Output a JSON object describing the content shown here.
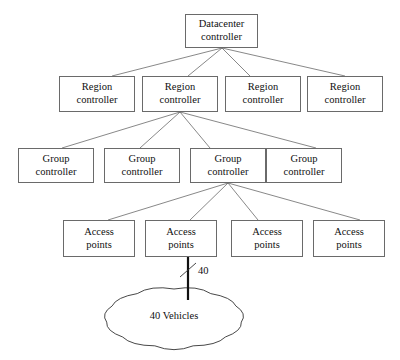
{
  "diagram": {
    "style": {
      "box_border_color": "#6a6a6a",
      "box_fill_color": "#ffffff",
      "edge_color": "#6a6a6a",
      "trunk_color": "#111111",
      "text_color": "#101010",
      "background": "#ffffff"
    },
    "levels": [
      {
        "name": "datacenter",
        "nodes": [
          {
            "line1": "Datacenter",
            "line2": "controller",
            "x": 185,
            "y": 14,
            "w": 73,
            "h": 34
          }
        ]
      },
      {
        "name": "region",
        "nodes": [
          {
            "line1": "Region",
            "line2": "controller",
            "x": 59,
            "y": 76,
            "w": 76,
            "h": 36
          },
          {
            "line1": "Region",
            "line2": "controller",
            "x": 142,
            "y": 76,
            "w": 76,
            "h": 36
          },
          {
            "line1": "Region",
            "line2": "controller",
            "x": 225,
            "y": 76,
            "w": 76,
            "h": 36
          },
          {
            "line1": "Region",
            "line2": "controller",
            "x": 307,
            "y": 76,
            "w": 76,
            "h": 36
          }
        ]
      },
      {
        "name": "group",
        "nodes": [
          {
            "line1": "Group",
            "line2": "controller",
            "x": 18,
            "y": 148,
            "w": 76,
            "h": 35
          },
          {
            "line1": "Group",
            "line2": "controller",
            "x": 104,
            "y": 148,
            "w": 76,
            "h": 35
          },
          {
            "line1": "Group",
            "line2": "controller",
            "x": 190,
            "y": 148,
            "w": 76,
            "h": 35
          },
          {
            "line1": "Group",
            "line2": "controller",
            "x": 266,
            "y": 148,
            "w": 76,
            "h": 35
          }
        ]
      },
      {
        "name": "access",
        "nodes": [
          {
            "line1": "Access",
            "line2": "points",
            "x": 63,
            "y": 220,
            "w": 72,
            "h": 37
          },
          {
            "line1": "Access",
            "line2": "points",
            "x": 145,
            "y": 220,
            "w": 72,
            "h": 37
          },
          {
            "line1": "Access",
            "line2": "points",
            "x": 231,
            "y": 220,
            "w": 72,
            "h": 37
          },
          {
            "line1": "Access",
            "line2": "points",
            "x": 313,
            "y": 220,
            "w": 72,
            "h": 37
          }
        ]
      }
    ],
    "cloud": {
      "label": "40 Vehicles",
      "cx": 174,
      "cy": 318,
      "rx": 68,
      "ry": 29
    },
    "trunk": {
      "label": "40",
      "from_x": 188,
      "from_y": 257,
      "to_x": 188,
      "to_y": 300,
      "label_x": 198,
      "label_y": 265
    },
    "edges": [
      {
        "from": "datacenter-0",
        "to": "region-0",
        "x1": 222,
        "y1": 48,
        "x2": 112,
        "y2": 76
      },
      {
        "from": "datacenter-0",
        "to": "region-1",
        "x1": 222,
        "y1": 48,
        "x2": 188,
        "y2": 76
      },
      {
        "from": "datacenter-0",
        "to": "region-2",
        "x1": 222,
        "y1": 48,
        "x2": 250,
        "y2": 76
      },
      {
        "from": "datacenter-0",
        "to": "region-3",
        "x1": 222,
        "y1": 48,
        "x2": 345,
        "y2": 76
      },
      {
        "from": "region-1",
        "to": "group-0",
        "x1": 180,
        "y1": 112,
        "x2": 62,
        "y2": 148
      },
      {
        "from": "region-1",
        "to": "group-1",
        "x1": 180,
        "y1": 112,
        "x2": 140,
        "y2": 148
      },
      {
        "from": "region-1",
        "to": "group-2",
        "x1": 180,
        "y1": 112,
        "x2": 210,
        "y2": 148
      },
      {
        "from": "region-1",
        "to": "group-3",
        "x1": 180,
        "y1": 112,
        "x2": 316,
        "y2": 148
      },
      {
        "from": "group-2",
        "to": "access-0",
        "x1": 228,
        "y1": 183,
        "x2": 108,
        "y2": 220
      },
      {
        "from": "group-2",
        "to": "access-1",
        "x1": 228,
        "y1": 183,
        "x2": 190,
        "y2": 220
      },
      {
        "from": "group-2",
        "to": "access-2",
        "x1": 228,
        "y1": 183,
        "x2": 258,
        "y2": 220
      },
      {
        "from": "group-2",
        "to": "access-3",
        "x1": 228,
        "y1": 183,
        "x2": 360,
        "y2": 220
      }
    ]
  }
}
